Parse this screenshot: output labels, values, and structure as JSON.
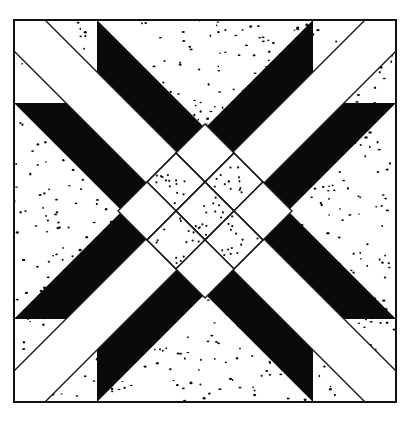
{
  "diagram": {
    "type": "quilt-block",
    "canvas": {
      "width": 410,
      "height": 421
    },
    "block": {
      "x": 14,
      "y": 20,
      "size": 382,
      "border_width": 2
    },
    "colors": {
      "background": "#ffffff",
      "dark": "#0a0a0a",
      "light": "#ffffff",
      "speckle": "#111111",
      "line": "#1a1a1a"
    },
    "fabrics": [
      "solid black",
      "plain white",
      "white with black speckles"
    ],
    "geometry": {
      "lattice_half_step": 29,
      "white_band_offset": 31,
      "black_band_outer_offset": 83,
      "lattice_radius": 87
    },
    "regions": {
      "arms": [
        "north-west",
        "north-east",
        "south-east",
        "south-west"
      ],
      "center_lattice": {
        "rows": 3,
        "cols": 3,
        "cells": [
          [
            "white",
            "speckled",
            "white"
          ],
          [
            "speckled",
            "speckled",
            "speckled"
          ],
          [
            "white",
            "speckled",
            "white"
          ]
        ]
      }
    },
    "speckle_count": 700
  }
}
